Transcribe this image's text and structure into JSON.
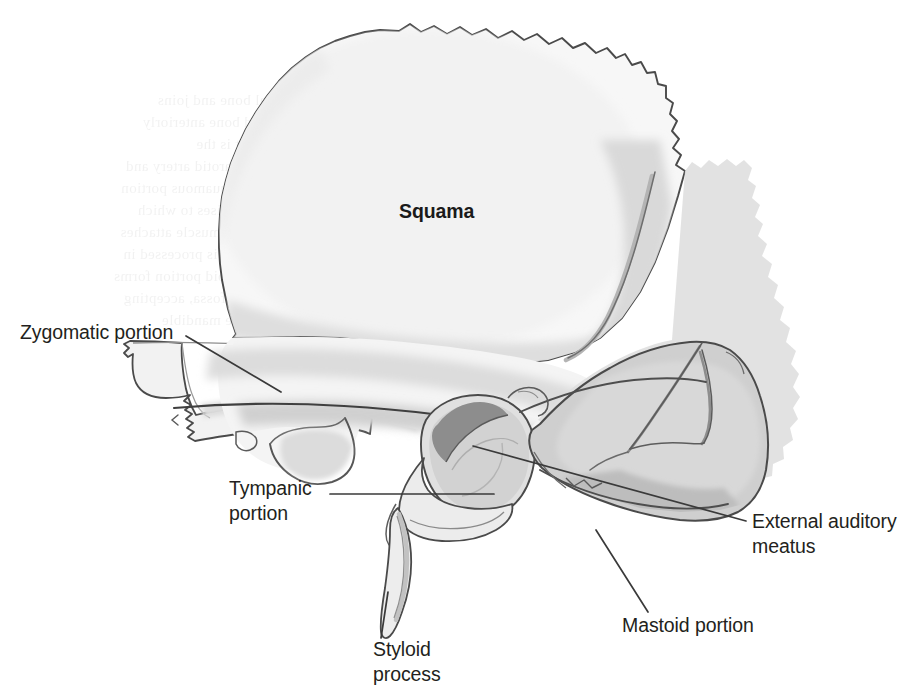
{
  "figure": {
    "background_color": "#ffffff",
    "width": 916,
    "height": 700
  },
  "palette": {
    "outline": "#4a4a4a",
    "outline_dark": "#3b3b3b",
    "inner_line": "#6e6e6e",
    "fill_lightest": "#fafafa",
    "fill_light": "#f0f0f0",
    "fill_mid_light": "#e2e2e2",
    "fill_mid": "#d2d2d2",
    "fill_gray": "#c6c6c6",
    "fill_dark": "#9a9a9a",
    "meatus_shadow": "#8d8d8d",
    "label_text": "#231f20",
    "leader_line": "#3a3a3a"
  },
  "labels": [
    {
      "id": "squama",
      "text": "Squama",
      "bold": true,
      "x": 399,
      "y": 218,
      "anchor": "start",
      "has_leader": false
    },
    {
      "id": "zygomatic-portion",
      "text": "Zygomatic portion",
      "bold": false,
      "x": 20,
      "y": 339,
      "anchor": "start",
      "has_leader": true,
      "leader": {
        "x1": 186,
        "y1": 336,
        "x2": 281,
        "y2": 392
      }
    },
    {
      "id": "tympanic-portion",
      "lines": [
        "Tympanic",
        "portion"
      ],
      "bold": false,
      "x": 229,
      "y": 495,
      "anchor": "start",
      "line_height": 25,
      "has_leader": true,
      "leader": {
        "x1": 330,
        "y1": 494,
        "x2": 494,
        "y2": 494
      }
    },
    {
      "id": "external-auditory-meatus",
      "lines": [
        "External auditory",
        "meatus"
      ],
      "bold": false,
      "x": 752,
      "y": 528,
      "anchor": "start",
      "line_height": 25,
      "has_leader": true,
      "leader": {
        "x1": 473,
        "y1": 446,
        "x2": 746,
        "y2": 521
      }
    },
    {
      "id": "mastoid-portion",
      "text": "Mastoid portion",
      "bold": false,
      "x": 622,
      "y": 632,
      "anchor": "start",
      "has_leader": true,
      "leader": {
        "x1": 596,
        "y1": 530,
        "x2": 648,
        "y2": 612
      }
    },
    {
      "id": "styloid-process",
      "lines": [
        "Styloid",
        "process"
      ],
      "bold": false,
      "x": 373,
      "y": 656,
      "anchor": "start",
      "line_height": 25,
      "has_leader": true,
      "leader": {
        "x1": 388,
        "y1": 592,
        "x2": 381,
        "y2": 638
      }
    }
  ],
  "ghost_text": {
    "note": "faint show-through text from reverse of printed page, illegible",
    "opacity": 0.085,
    "rows": [
      {
        "x": 335,
        "y": 105,
        "text": "the temporal bone and joins"
      },
      {
        "x": 325,
        "y": 127,
        "text": "the sphenoid bone anteriorly"
      },
      {
        "x": 330,
        "y": 149,
        "text": "in a suture that is the"
      },
      {
        "x": 318,
        "y": 171,
        "text": "the external carotid artery and"
      },
      {
        "x": 322,
        "y": 193,
        "text": "runs over the squamous portion"
      },
      {
        "x": 330,
        "y": 215,
        "text": "of the skull and rises to which"
      },
      {
        "x": 316,
        "y": 237,
        "text": "the temporalis muscle attaches"
      },
      {
        "x": 330,
        "y": 259,
        "text": "The tubercle that is processed in"
      },
      {
        "x": 322,
        "y": 281,
        "text": "below the mastoid portion forms"
      },
      {
        "x": 326,
        "y": 303,
        "text": "the mandibular fossa, accepting"
      },
      {
        "x": 340,
        "y": 325,
        "text": "the condyle of the mandible"
      }
    ]
  },
  "regions": [
    {
      "id": "squama-region",
      "name": "Squama"
    },
    {
      "id": "zygomatic-region",
      "name": "Zygomatic portion"
    },
    {
      "id": "tympanic-region",
      "name": "Tympanic portion"
    },
    {
      "id": "mastoid-region",
      "name": "Mastoid portion"
    },
    {
      "id": "styloid-region",
      "name": "Styloid process"
    },
    {
      "id": "meatus-region",
      "name": "External auditory meatus"
    }
  ]
}
